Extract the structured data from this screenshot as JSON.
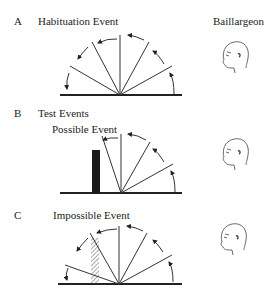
{
  "panels": [
    {
      "letter": "A",
      "title": "Habituation Event",
      "subtitle": ""
    },
    {
      "letter": "B",
      "title": "Test Events",
      "subtitle": "Possible Event"
    },
    {
      "letter": "C",
      "title": "",
      "subtitle": "Impossible Event"
    }
  ],
  "author": "Baillargeon",
  "icons": [
    "infant-head-icon",
    "infant-head-icon",
    "infant-head-icon"
  ],
  "colors": {
    "line": "#333333",
    "block": "#1a1a1a"
  }
}
